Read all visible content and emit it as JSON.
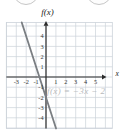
{
  "page": {
    "background": "#ffffff",
    "decorative_icons": [
      "cropped-circle-left",
      "cropped-circle-right"
    ]
  },
  "chart_data": {
    "type": "line",
    "title": "",
    "xlabel": "x",
    "ylabel": "f(x)",
    "equation_label": "f(x) = −3x − 2",
    "series": [
      {
        "name": "f(x) = -3x - 2",
        "slope": -3,
        "intercept": -2,
        "color": "#7a7e82",
        "points": [
          [
            -2.33,
            5
          ],
          [
            -0.667,
            0
          ],
          [
            0,
            -2
          ],
          [
            1,
            -5
          ]
        ]
      }
    ],
    "x_ticks": [
      -3,
      -2,
      -1,
      1,
      2,
      3,
      4,
      5
    ],
    "y_ticks": [
      -4,
      -3,
      -2,
      -1,
      1,
      2,
      3,
      4
    ],
    "xlim": [
      -4,
      6.7
    ],
    "ylim": [
      -5.05,
      5.35
    ],
    "grid": true,
    "grid_color": "#ccd3da",
    "axis_color": "#2a2a2a",
    "tick_color": "#333333",
    "equation_color": "#b8babc",
    "x_intercept": -0.667,
    "y_intercept": -2
  }
}
